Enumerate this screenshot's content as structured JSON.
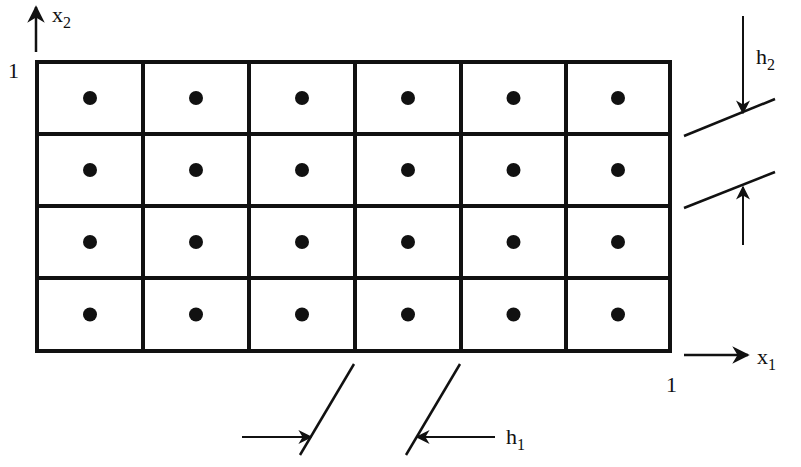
{
  "figure": {
    "width": 801,
    "height": 467,
    "colors": {
      "ink": "#111111",
      "background": "#ffffff"
    }
  },
  "grid": {
    "columns": 6,
    "rows": 4,
    "x_lines": [
      37,
      143,
      249,
      355,
      461,
      566,
      670
    ],
    "y_lines": [
      62,
      134,
      206,
      278,
      351
    ],
    "stroke_width": 4,
    "dot_radius": 7
  },
  "axes": {
    "x1": {
      "label": "x",
      "subscript": "1",
      "tick_label": "1",
      "arrow_from": [
        684,
        355
      ],
      "arrow_to": [
        748,
        355
      ]
    },
    "x2": {
      "label": "x",
      "subscript": "2",
      "tick_label": "1",
      "arrow_from": [
        36,
        52
      ],
      "arrow_to": [
        36,
        7
      ]
    }
  },
  "dimensions": {
    "h1": {
      "label": "h",
      "subscript": "1",
      "extension_lines": [
        [
          [
            354,
            364
          ],
          [
            300,
            455
          ]
        ],
        [
          [
            460,
            364
          ],
          [
            406,
            455
          ]
        ]
      ],
      "arrow_left": {
        "from": [
          242,
          437
        ],
        "to": [
          311,
          437
        ]
      },
      "arrow_right": {
        "from": [
          495,
          437
        ],
        "to": [
          417,
          437
        ]
      }
    },
    "h2": {
      "label": "h",
      "subscript": "2",
      "extension_lines": [
        [
          [
            684,
            136
          ],
          [
            775,
            99
          ]
        ],
        [
          [
            684,
            208
          ],
          [
            775,
            172
          ]
        ]
      ],
      "arrow_top": {
        "from": [
          743,
          16
        ],
        "to": [
          743,
          113
        ]
      },
      "arrow_bottom": {
        "from": [
          743,
          245
        ],
        "to": [
          743,
          187
        ]
      }
    }
  }
}
